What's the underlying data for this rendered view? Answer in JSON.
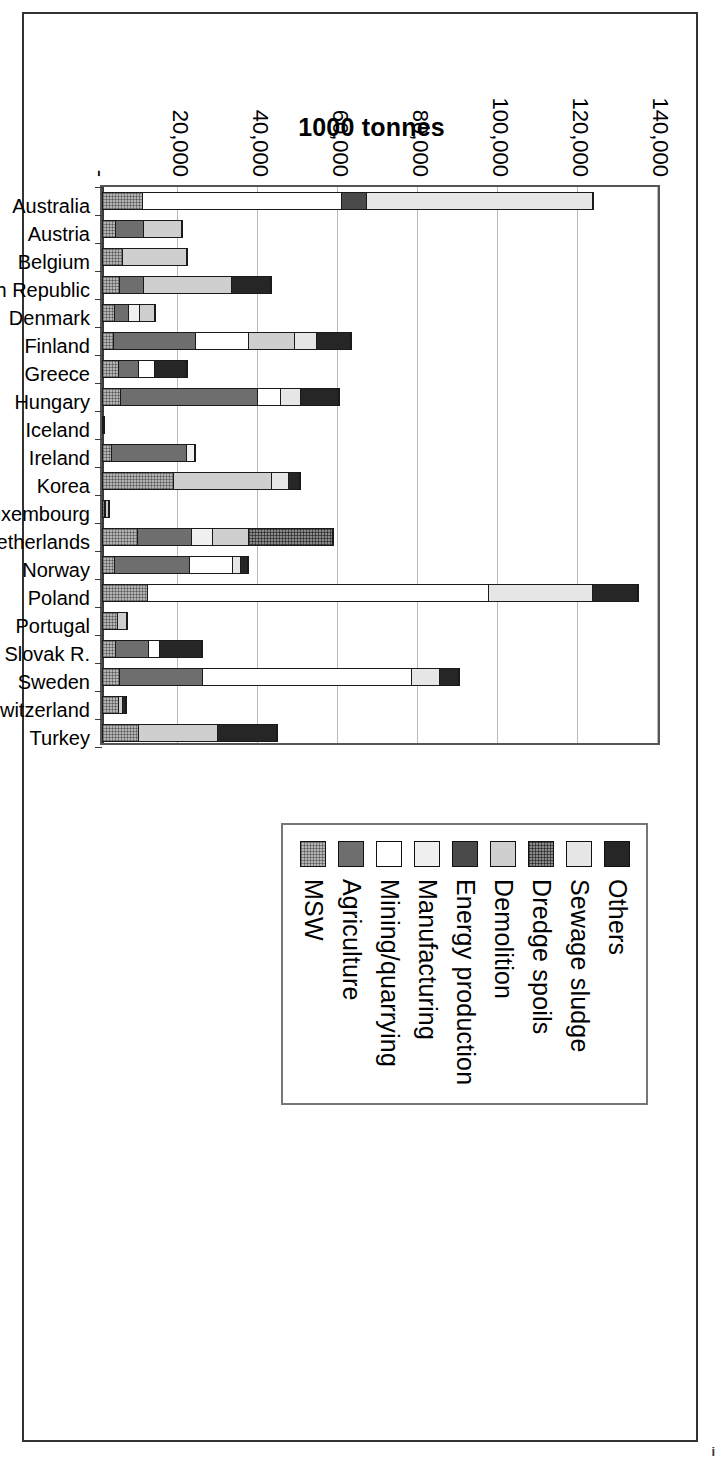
{
  "figure": {
    "value_axis_title": "1000 tonnes",
    "page_artifact": "i"
  },
  "legend": {
    "items": [
      {
        "label": "Others",
        "key": "others",
        "swatch": "dark-solid-swatch"
      },
      {
        "label": "Sewage sludge",
        "key": "sewage",
        "swatch": "light-gray-swatch"
      },
      {
        "label": "Dredge spoils",
        "key": "dredge",
        "swatch": "dark-hatch-swatch"
      },
      {
        "label": "Demolition",
        "key": "demolition",
        "swatch": "mid-light-gray-swatch"
      },
      {
        "label": "Energy production",
        "key": "energy",
        "swatch": "dark-gray-swatch"
      },
      {
        "label": "Manufacturing",
        "key": "manufacturing",
        "swatch": "near-white-swatch"
      },
      {
        "label": "Mining/quarrying",
        "key": "mining",
        "swatch": "white-swatch"
      },
      {
        "label": "Agriculture",
        "key": "agriculture",
        "swatch": "gray-swatch"
      },
      {
        "label": "MSW",
        "key": "msw",
        "swatch": "gray-hatch-swatch"
      }
    ]
  },
  "chart_data": {
    "type": "bar",
    "orientation": "horizontal-stacked",
    "title": "",
    "xlabel": "",
    "ylabel": "1000 tonnes",
    "ylim": [
      0,
      140000
    ],
    "yticks": [
      0,
      20000,
      40000,
      60000,
      80000,
      100000,
      120000,
      140000
    ],
    "ytick_labels": [
      "-",
      "20,000",
      "40,000",
      "60,000",
      "80,000",
      "100,000",
      "120,000",
      "140,000"
    ],
    "grid": true,
    "legend_position": "right",
    "stack_order": [
      "msw",
      "agriculture",
      "mining",
      "manufacturing",
      "energy",
      "demolition",
      "dredge",
      "sewage",
      "others"
    ],
    "categories": [
      "Australia",
      "Austria",
      "Belgium",
      "Czech Republic",
      "Denmark",
      "Finland",
      "Greece",
      "Hungary",
      "Iceland",
      "Ireland",
      "Korea",
      "Luxembourg",
      "Netherlands",
      "Norway",
      "Poland",
      "Portugal",
      "Slovak R.",
      "Sweden",
      "Switzerland",
      "Turkey"
    ],
    "series": [
      {
        "name": "MSW",
        "key": "msw",
        "values": [
          10000,
          3100,
          4900,
          4200,
          3000,
          2500,
          3900,
          4500,
          200,
          2100,
          18000,
          400,
          8800,
          2800,
          11200,
          4000,
          3300,
          4000,
          4800,
          9000
        ]
      },
      {
        "name": "Agriculture",
        "key": "agriculture",
        "values": [
          0,
          7400,
          0,
          5900,
          3800,
          21000,
          5200,
          35000,
          0,
          19500,
          0,
          0,
          13500,
          19500,
          0,
          0,
          8500,
          21000,
          0,
          0
        ]
      },
      {
        "name": "Mining/quarrying",
        "key": "mining",
        "values": [
          50000,
          0,
          0,
          0,
          0,
          13500,
          4000,
          5500,
          0,
          0,
          0,
          600,
          0,
          11000,
          86000,
          0,
          2500,
          53000,
          0,
          0
        ]
      },
      {
        "name": "Manufacturing",
        "key": "manufacturing",
        "values": [
          0,
          0,
          0,
          0,
          2700,
          0,
          0,
          0,
          0,
          2000,
          0,
          0,
          5200,
          0,
          0,
          0,
          0,
          0,
          0,
          0
        ]
      },
      {
        "name": "Energy production",
        "key": "energy",
        "values": [
          6000,
          0,
          0,
          0,
          0,
          0,
          0,
          0,
          0,
          0,
          0,
          0,
          0,
          0,
          0,
          0,
          0,
          0,
          0,
          0
        ]
      },
      {
        "name": "Demolition",
        "key": "demolition",
        "values": [
          0,
          9800,
          16500,
          22500,
          4100,
          11500,
          0,
          0,
          0,
          0,
          25000,
          900,
          9000,
          0,
          0,
          2600,
          0,
          0,
          700,
          20000
        ]
      },
      {
        "name": "Dredge spoils",
        "key": "dredge",
        "values": [
          0,
          0,
          0,
          0,
          0,
          0,
          0,
          0,
          0,
          0,
          0,
          0,
          21500,
          0,
          0,
          0,
          0,
          0,
          0,
          0
        ]
      },
      {
        "name": "Sewage sludge",
        "key": "sewage",
        "values": [
          57000,
          0,
          0,
          0,
          0,
          5500,
          0,
          5000,
          0,
          0,
          4200,
          0,
          0,
          2000,
          26000,
          0,
          0,
          7000,
          0,
          0
        ]
      },
      {
        "name": "Others",
        "key": "others",
        "values": [
          0,
          0,
          0,
          10000,
          0,
          8500,
          8500,
          9500,
          600,
          0,
          2500,
          0,
          0,
          1500,
          11000,
          0,
          11000,
          4500,
          700,
          15000
        ]
      }
    ]
  }
}
